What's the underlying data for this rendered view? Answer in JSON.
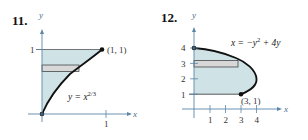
{
  "figures": [
    {
      "number": "11.",
      "axis_x_label": "x",
      "axis_y_label": "y",
      "x_ticks": [
        "1"
      ],
      "y_ticks": [
        "1"
      ],
      "curve_equation_prefix": "y = x",
      "curve_equation_exponent": "2/3",
      "point_label": "(1, 1)",
      "region": "between y-axis and y = x^(2/3) for 0 ≤ y ≤ 1",
      "representative_rectangle": "horizontal"
    },
    {
      "number": "12.",
      "axis_x_label": "x",
      "axis_y_label": "y",
      "x_ticks": [
        "1",
        "2",
        "3",
        "4"
      ],
      "y_ticks": [
        "1",
        "2",
        "3",
        "4"
      ],
      "curve_equation": "x = −y² + 4y",
      "curve_equation_prefix": "x = −y",
      "curve_equation_exponent": "2",
      "curve_equation_suffix": " + 4y",
      "point_label": "(3, 1)",
      "region": "between y-axis and x = −y² + 4y for 1 ≤ y ≤ 4",
      "representative_rectangle": "horizontal"
    }
  ],
  "colors": {
    "region_fill": "#cfe3e6",
    "rectangle_fill": "#d8d8d8",
    "axis": "#5a86a8",
    "curve": "#111111"
  }
}
